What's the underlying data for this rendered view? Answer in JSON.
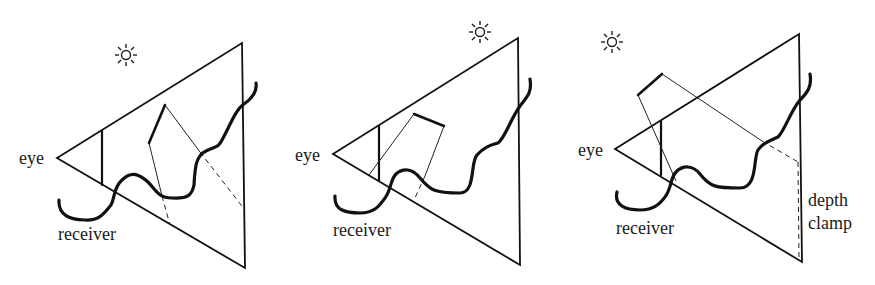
{
  "figure": {
    "panels": [
      {
        "id": "panel-1",
        "labels": {
          "eye": "eye",
          "receiver": "receiver"
        },
        "icons": [
          "sun-icon"
        ]
      },
      {
        "id": "panel-2",
        "labels": {
          "eye": "eye",
          "receiver": "receiver"
        },
        "icons": [
          "sun-icon"
        ]
      },
      {
        "id": "panel-3",
        "labels": {
          "eye": "eye",
          "receiver": "receiver",
          "depth_line1": "depth",
          "depth_line2": "clamp"
        },
        "icons": [
          "sun-icon"
        ]
      }
    ]
  }
}
